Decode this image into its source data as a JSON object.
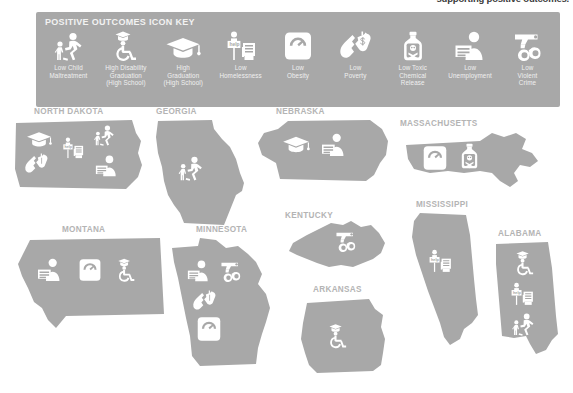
{
  "page": {
    "headline_fragment": "supporting positive outcomes.",
    "background_color": "#ffffff",
    "state_fill_color": "#a8a8a8",
    "icon_color": "#ffffff",
    "label_color": "#b4b4b4",
    "legend_bg_color": "#a8a8a8"
  },
  "legend": {
    "title": "POSITIVE OUTCOMES ICON KEY",
    "items": [
      {
        "icon": "child-running-icon",
        "label": "Low Child\nMaltreatment"
      },
      {
        "icon": "wheelchair-graduate-icon",
        "label": "High Disability\nGraduation\n(High School)"
      },
      {
        "icon": "graduation-cap-icon",
        "label": "High\nGraduation\n(High School)"
      },
      {
        "icon": "homeless-help-sign-icon",
        "label": "Low\nHomelessness"
      },
      {
        "icon": "bathroom-scale-icon",
        "label": "Low\nObesity"
      },
      {
        "icon": "torn-dollar-icon",
        "label": "Low\nPoverty"
      },
      {
        "icon": "toxic-bottle-icon",
        "label": "Low Toxic\nChemical\nRelease"
      },
      {
        "icon": "jobless-person-icon",
        "label": "Low\nUnemployment"
      },
      {
        "icon": "gun-handcuffs-icon",
        "label": "Low\nViolent\nCrime"
      }
    ]
  },
  "states": [
    {
      "id": "north-dakota",
      "name": "NORTH DAKOTA",
      "icons": [
        "graduation-cap-icon",
        "homeless-help-sign-icon",
        "child-running-icon",
        "torn-dollar-icon",
        "jobless-person-icon"
      ],
      "icon_count": 5
    },
    {
      "id": "georgia",
      "name": "GEORGIA",
      "icons": [
        "child-running-icon"
      ],
      "icon_count": 1
    },
    {
      "id": "nebraska",
      "name": "NEBRASKA",
      "icons": [
        "graduation-cap-icon",
        "jobless-person-icon"
      ],
      "icon_count": 2
    },
    {
      "id": "massachusetts",
      "name": "MASSACHUSETTS",
      "icons": [
        "bathroom-scale-icon",
        "toxic-bottle-icon"
      ],
      "icon_count": 2
    },
    {
      "id": "montana",
      "name": "MONTANA",
      "icons": [
        "jobless-person-icon",
        "bathroom-scale-icon",
        "wheelchair-graduate-icon"
      ],
      "icon_count": 3
    },
    {
      "id": "minnesota",
      "name": "MINNESOTA",
      "icons": [
        "jobless-person-icon",
        "gun-handcuffs-icon",
        "torn-dollar-icon",
        "bathroom-scale-icon"
      ],
      "icon_count": 4
    },
    {
      "id": "kentucky",
      "name": "KENTUCKY",
      "icons": [
        "gun-handcuffs-icon"
      ],
      "icon_count": 1
    },
    {
      "id": "mississippi",
      "name": "MISSISSIPPI",
      "icons": [
        "homeless-help-sign-icon"
      ],
      "icon_count": 1
    },
    {
      "id": "arkansas",
      "name": "ARKANSAS",
      "icons": [
        "wheelchair-graduate-icon"
      ],
      "icon_count": 1
    },
    {
      "id": "alabama",
      "name": "ALABAMA",
      "icons": [
        "wheelchair-graduate-icon",
        "homeless-help-sign-icon",
        "child-running-icon"
      ],
      "icon_count": 3
    }
  ]
}
